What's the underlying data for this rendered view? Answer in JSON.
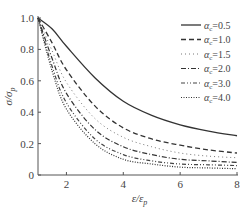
{
  "chart_data": {
    "type": "line",
    "title": "",
    "xlabel": "ε/ε_p",
    "ylabel": "σ/σ_p",
    "xlim": [
      1,
      8
    ],
    "ylim": [
      0,
      1.0
    ],
    "x_ticks": [
      "2",
      "4",
      "6",
      "8"
    ],
    "y_ticks": [
      "0",
      "0.2",
      "0.4",
      "0.6",
      "0.8",
      "1.0"
    ],
    "grid": false,
    "legend_position": "upper right",
    "x": [
      1,
      1.5,
      2,
      3,
      4,
      5,
      6,
      7,
      8
    ],
    "series": [
      {
        "name": "αc=0.5",
        "style": "solid",
        "values": [
          1.0,
          0.93,
          0.82,
          0.62,
          0.47,
          0.38,
          0.32,
          0.28,
          0.25
        ]
      },
      {
        "name": "αc=1.0",
        "style": "dashed",
        "values": [
          1.0,
          0.84,
          0.67,
          0.44,
          0.3,
          0.23,
          0.19,
          0.16,
          0.14
        ]
      },
      {
        "name": "αc=1.5",
        "style": "dotted",
        "values": [
          1.0,
          0.79,
          0.59,
          0.36,
          0.24,
          0.18,
          0.14,
          0.12,
          0.11
        ]
      },
      {
        "name": "αc=2.0",
        "style": "dash-dot",
        "values": [
          1.0,
          0.74,
          0.52,
          0.29,
          0.18,
          0.13,
          0.1,
          0.09,
          0.08
        ]
      },
      {
        "name": "αc=3.0",
        "style": "dash-dot-dot",
        "values": [
          1.0,
          0.69,
          0.46,
          0.23,
          0.13,
          0.09,
          0.07,
          0.065,
          0.06
        ]
      },
      {
        "name": "αc=4.0",
        "style": "fine-dotted",
        "values": [
          1.0,
          0.66,
          0.42,
          0.2,
          0.1,
          0.07,
          0.05,
          0.045,
          0.04
        ]
      }
    ]
  },
  "legend": {
    "items": [
      {
        "prefix": "α",
        "sub": "c",
        "value": "=0.5"
      },
      {
        "prefix": "α",
        "sub": "c",
        "value": "=1.0"
      },
      {
        "prefix": "α",
        "sub": "c",
        "value": "=1.5"
      },
      {
        "prefix": "α",
        "sub": "c",
        "value": "=2.0"
      },
      {
        "prefix": "α",
        "sub": "c",
        "value": "=3.0"
      },
      {
        "prefix": "α",
        "sub": "c",
        "value": "=4.0"
      }
    ]
  },
  "axes": {
    "x_label_main": "ε/ε",
    "x_label_sub": "p",
    "y_label_main": "σ/σ",
    "y_label_sub": "p"
  }
}
